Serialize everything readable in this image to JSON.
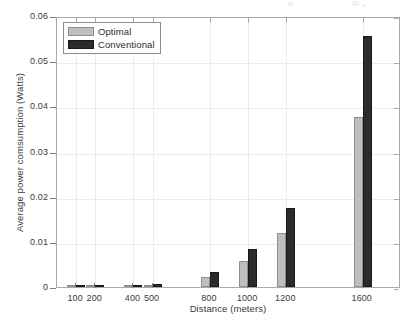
{
  "chart_data": {
    "type": "bar",
    "title": "",
    "xlabel": "Distance (meters)",
    "ylabel": "Average power comsumption (Watts)",
    "categories": [
      "100",
      "200",
      "400",
      "500",
      "800",
      "1000",
      "1200",
      "1600"
    ],
    "series": [
      {
        "name": "Optimal",
        "color": "#bfbfbf",
        "values": [
          2e-05,
          4e-05,
          0.00018,
          0.00048,
          0.0023,
          0.0058,
          0.012,
          0.0377
        ]
      },
      {
        "name": "Conventional",
        "color": "#2b2b2b",
        "values": [
          3e-05,
          6e-05,
          0.00025,
          0.00062,
          0.0034,
          0.0085,
          0.0175,
          0.0555
        ]
      }
    ],
    "ylim": [
      0,
      0.06
    ],
    "yticks": [
      "0",
      "0.01",
      "0.02",
      "0.03",
      "0.04",
      "0.05",
      "0.06"
    ],
    "ytick_values": [
      0,
      0.01,
      0.02,
      0.03,
      0.04,
      0.05,
      0.06
    ],
    "xlim": [
      0,
      1800
    ],
    "grid": true,
    "legend_position": "top-left",
    "legend": [
      "Optimal",
      "Conventional"
    ]
  }
}
